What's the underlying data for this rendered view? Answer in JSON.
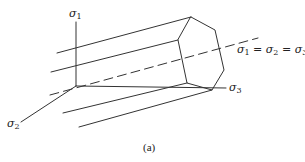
{
  "diagram": {
    "type": "principal-stress-space",
    "labels": {
      "sigma1": "σ",
      "sigma1_sub": "1",
      "sigma2": "σ",
      "sigma2_sub": "2",
      "sigma3": "σ",
      "sigma3_sub": "3",
      "hydrostatic_axis": {
        "s1": "σ",
        "s1_sub": "1",
        "eq1": " = ",
        "s2": "σ",
        "s2_sub": "2",
        "eq2": " = ",
        "s3": "σ",
        "s3_sub": "3"
      }
    },
    "caption": "(a)",
    "colors": {
      "line": "#333333",
      "background": "#ffffff"
    }
  }
}
